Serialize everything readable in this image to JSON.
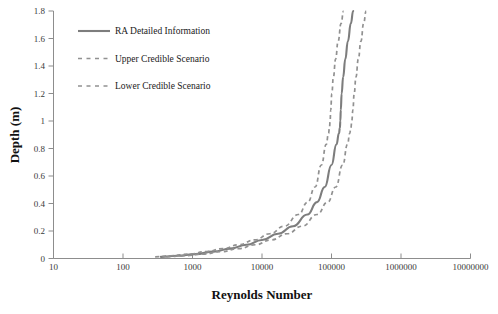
{
  "chart_data": {
    "type": "line",
    "title": "",
    "xlabel": "Reynolds Number",
    "ylabel": "Depth (m)",
    "xscale": "log",
    "yscale": "linear",
    "xlim": [
      10,
      10000000
    ],
    "ylim": [
      0,
      1.8
    ],
    "grid": false,
    "legend_position": "top-left inside plot",
    "xticklabels": [
      "10",
      "100",
      "1000",
      "10000",
      "100000",
      "1000000",
      "10000000"
    ],
    "xtickvalues": [
      10,
      100,
      1000,
      10000,
      100000,
      1000000,
      10000000
    ],
    "yticklabels": [
      "0",
      "0.2",
      "0.4",
      "0.6",
      "0.8",
      "1",
      "1.2",
      "1.4",
      "1.6",
      "1.8"
    ],
    "ytickvalues": [
      0,
      0.2,
      0.4,
      0.6,
      0.8,
      1.0,
      1.2,
      1.4,
      1.6,
      1.8
    ],
    "series": [
      {
        "name": "RA Detailed Information",
        "style": "solid",
        "color": "#7d7d7d",
        "x": [
          350,
          600,
          1100,
          2000,
          3500,
          6000,
          10000,
          17000,
          28000,
          45000,
          62000,
          80000,
          100000,
          118000,
          128000,
          132000,
          134000,
          136000,
          140000,
          147000,
          158000,
          172000,
          190000,
          205000
        ],
        "y": [
          0.012,
          0.02,
          0.032,
          0.05,
          0.072,
          0.1,
          0.135,
          0.18,
          0.235,
          0.32,
          0.41,
          0.52,
          0.68,
          0.83,
          0.91,
          0.95,
          1.0,
          1.08,
          1.2,
          1.32,
          1.45,
          1.58,
          1.71,
          1.8
        ]
      },
      {
        "name": "Upper Credible Scenario",
        "style": "dashed",
        "color": "#919191",
        "x": [
          420,
          740,
          1400,
          2600,
          4600,
          8000,
          13500,
          23000,
          38000,
          62000,
          88000,
          115000,
          145000,
          170000,
          183000,
          190000,
          196000,
          203000,
          212000,
          225000,
          243000,
          265000,
          290000,
          315000
        ],
        "y": [
          0.012,
          0.02,
          0.032,
          0.05,
          0.072,
          0.1,
          0.135,
          0.18,
          0.235,
          0.32,
          0.41,
          0.52,
          0.68,
          0.83,
          0.91,
          0.95,
          1.0,
          1.08,
          1.2,
          1.32,
          1.45,
          1.58,
          1.71,
          1.8
        ]
      },
      {
        "name": "Lower Credible Scenario",
        "style": "dashed",
        "color": "#919191",
        "x": [
          290,
          490,
          880,
          1580,
          2750,
          4700,
          7800,
          13000,
          21000,
          33500,
          45500,
          58000,
          71500,
          84000,
          90500,
          93500,
          95500,
          97500,
          101000,
          106500,
          114500,
          124500,
          137500,
          149000
        ],
        "y": [
          0.012,
          0.02,
          0.032,
          0.05,
          0.072,
          0.1,
          0.135,
          0.18,
          0.235,
          0.32,
          0.41,
          0.52,
          0.68,
          0.83,
          0.91,
          0.95,
          1.0,
          1.08,
          1.2,
          1.32,
          1.45,
          1.58,
          1.71,
          1.8
        ]
      }
    ],
    "legend": [
      {
        "label": "RA Detailed Information",
        "style": "solid",
        "color": "#7d7d7d"
      },
      {
        "label": "Upper Credible Scenario",
        "style": "dashed",
        "color": "#919191"
      },
      {
        "label": "Lower Credible Scenario",
        "style": "dashed",
        "color": "#919191"
      }
    ],
    "colors": {
      "axis": "#8d8d8d",
      "tick_text": "#3a3a3a",
      "title_text": "#111111",
      "solid_series": "#7d7d7d",
      "dashed_series": "#919191",
      "background": "#ffffff"
    }
  }
}
